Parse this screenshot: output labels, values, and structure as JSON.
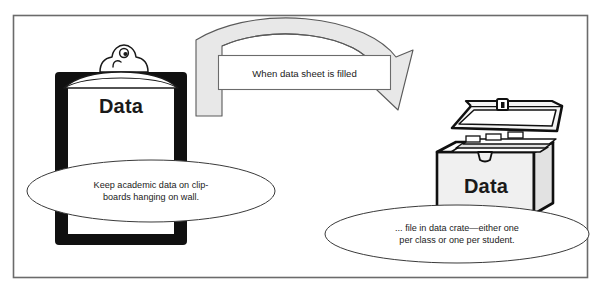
{
  "figure": {
    "type": "workflow-diagram",
    "border_color": "#6b6b6b",
    "background": "#ffffff",
    "ink_color": "#1a1a1a",
    "arrow_fill": "#e8e8e8"
  },
  "clipboard": {
    "label": "Data",
    "icon": "clipboard-icon",
    "board_color": "#101010",
    "paper_color": "#ffffff"
  },
  "crate": {
    "label": "Data",
    "icon": "file-crate-icon",
    "body_color": "#f0f0f0",
    "outline_color": "#101010"
  },
  "arrow": {
    "label": "When data sheet is filled",
    "direction": "left-to-right-curved-down"
  },
  "callouts": [
    {
      "id": "left-callout",
      "lines": [
        "Keep academic data on clip-",
        "boards hanging on wall."
      ]
    },
    {
      "id": "right-callout",
      "lines": [
        "... file in data crate—either one",
        "per class or one per student."
      ]
    }
  ]
}
